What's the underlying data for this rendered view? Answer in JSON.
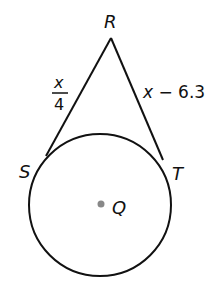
{
  "diagram": {
    "points": {
      "R": {
        "label": "R"
      },
      "S": {
        "label": "S"
      },
      "T": {
        "label": "T"
      },
      "Q": {
        "label": "Q"
      }
    },
    "segments": {
      "RS": {
        "numerator": "x",
        "denominator": "4"
      },
      "RT": {
        "var": "x",
        "rest": " − 6.3"
      }
    },
    "colors": {
      "stroke": "#111111",
      "center_dot": "#888888"
    }
  }
}
